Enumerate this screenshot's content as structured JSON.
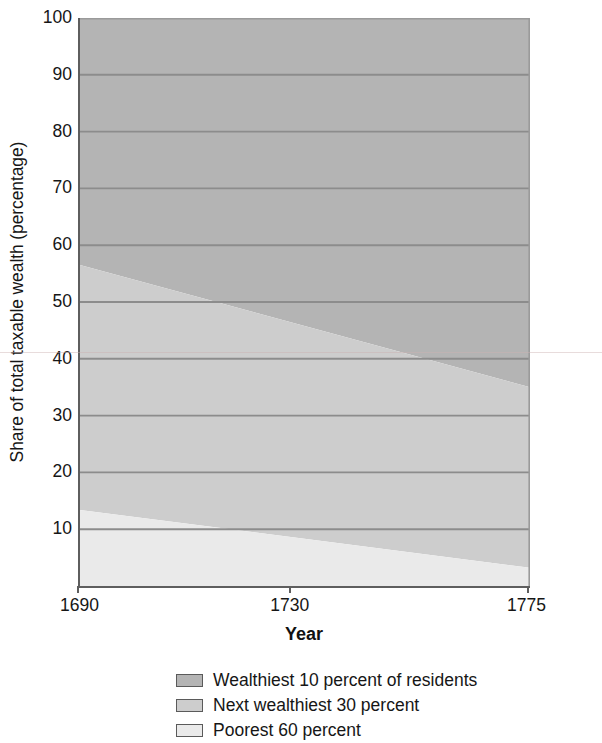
{
  "chart_data": {
    "type": "area",
    "title": "",
    "subtitle": "",
    "xlabel": "Year",
    "ylabel": "Share of total taxable wealth (percentage)",
    "stacked": true,
    "grid": true,
    "grid_orientation": "horizontal",
    "legend_position": "bottom",
    "x": [
      1690,
      1775
    ],
    "xlim": [
      1690,
      1775
    ],
    "ylim": [
      0,
      100
    ],
    "x_tick_labels": [
      "1690",
      "1730",
      "1775"
    ],
    "x_ticks": [
      1690,
      1730,
      1775
    ],
    "y_ticks": [
      10,
      20,
      30,
      40,
      50,
      60,
      70,
      80,
      90,
      100
    ],
    "y_tick_labels": [
      "10",
      "20",
      "30",
      "40",
      "50",
      "60",
      "70",
      "80",
      "90",
      "100"
    ],
    "series": [
      {
        "name": "Wealthiest 10 percent of residents",
        "values": [
          43.5,
          65.0
        ],
        "color": "#b4b4b4",
        "cumulative_top": [
          100,
          100
        ],
        "cumulative_bottom": [
          56.5,
          35.0
        ]
      },
      {
        "name": "Next wealthiest 30 percent",
        "values": [
          43.1,
          31.8
        ],
        "color": "#cdcdcd",
        "cumulative_top": [
          56.5,
          35.0
        ],
        "cumulative_bottom": [
          13.4,
          3.2
        ]
      },
      {
        "name": "Poorest 60 percent",
        "values": [
          13.4,
          3.2
        ],
        "color": "#eaeaea",
        "cumulative_top": [
          13.4,
          3.2
        ],
        "cumulative_bottom": [
          0,
          0
        ]
      }
    ]
  },
  "axes": {
    "y_title": "Share of total taxable wealth (percentage)",
    "x_title": "Year",
    "y_tick_labels": [
      "100",
      "90",
      "80",
      "70",
      "60",
      "50",
      "40",
      "30",
      "20",
      "10"
    ],
    "x_tick_labels": [
      "1690",
      "1730",
      "1775"
    ]
  },
  "legend": {
    "items": [
      {
        "label": "Wealthiest 10 percent of residents",
        "color": "#b4b4b4"
      },
      {
        "label": "Next wealthiest 30 percent",
        "color": "#cdcdcd"
      },
      {
        "label": "Poorest 60 percent",
        "color": "#eaeaea"
      }
    ]
  },
  "colors": {
    "band_dark": "#b4b4b4",
    "band_mid": "#cdcdcd",
    "band_light": "#eaeaea",
    "gridline": "#8c8c8c",
    "axis": "#5e5e5e",
    "text": "#161616",
    "background": "#ffffff"
  }
}
